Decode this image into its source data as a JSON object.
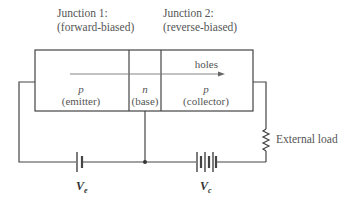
{
  "diagram": {
    "type": "pnp-transistor-circuit",
    "junctions": [
      {
        "title": "Junction 1:",
        "bias": "(forward-biased)"
      },
      {
        "title": "Junction 2:",
        "bias": "(reverse-biased)"
      }
    ],
    "regions": [
      {
        "type": "p",
        "name": "(emitter)"
      },
      {
        "type": "n",
        "name": "(base)"
      },
      {
        "type": "p",
        "name": "(collector)"
      }
    ],
    "flow_label": "holes",
    "load_label": "External load",
    "batteries": [
      {
        "label_main": "V",
        "label_sub": "e"
      },
      {
        "label_main": "V",
        "label_sub": "c"
      }
    ],
    "colors": {
      "line": "#444444",
      "text": "#555555"
    }
  }
}
